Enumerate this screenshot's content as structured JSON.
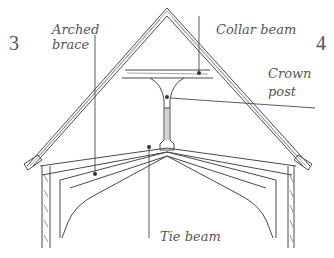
{
  "diagram": {
    "page_numbers": {
      "left": "3",
      "right": "4"
    },
    "labels": {
      "arched_brace": [
        "Arched",
        "brace"
      ],
      "collar_beam": "Collar beam",
      "crown_post": [
        "Crown",
        "post"
      ],
      "tie_beam": "Tie beam"
    },
    "colors": {
      "ink": "#555555",
      "line": "#4a4a4a",
      "background": "#ffffff"
    }
  }
}
